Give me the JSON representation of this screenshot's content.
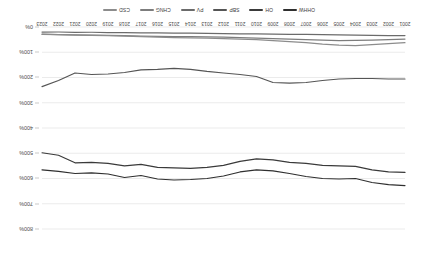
{
  "chart_data": {
    "type": "line",
    "title": "",
    "subtitle": "",
    "xlabel": "",
    "ylabel": "",
    "grid": true,
    "legend_position": "top",
    "orientation_note": "rendered rotated 180 degrees",
    "ylim": [
      0,
      800
    ],
    "yticks": [
      "0%",
      "100%",
      "200%",
      "300%",
      "400%",
      "500%",
      "600%",
      "700%",
      "800%"
    ],
    "ytick_values": [
      0,
      100,
      200,
      300,
      400,
      500,
      600,
      700,
      800
    ],
    "categories": [
      "2001",
      "2002",
      "2003",
      "2004",
      "2005",
      "2006",
      "2007",
      "2008",
      "2009",
      "2010",
      "2011",
      "2012",
      "2013",
      "2014",
      "2015",
      "2016",
      "2017",
      "2018",
      "2019",
      "2020",
      "2021",
      "2022",
      "2023"
    ],
    "series": [
      {
        "name": "OHHW",
        "color": "#2f2f2f",
        "values": [
          628,
          624,
          616,
          600,
          602,
          600,
          592,
          580,
          570,
          566,
          574,
          590,
          600,
          604,
          606,
          602,
          588,
          596,
          582,
          578,
          580,
          572,
          566
        ]
      },
      {
        "name": "OH",
        "color": "#3a3a3a",
        "values": [
          576,
          574,
          566,
          552,
          550,
          548,
          540,
          536,
          526,
          522,
          532,
          548,
          556,
          560,
          558,
          556,
          544,
          550,
          540,
          536,
          538,
          508,
          498
        ]
      },
      {
        "name": "SBP",
        "color": "#555555",
        "values": [
          206,
          206,
          204,
          204,
          206,
          212,
          220,
          222,
          220,
          196,
          188,
          182,
          176,
          168,
          164,
          168,
          170,
          180,
          186,
          188,
          182,
          212,
          236
        ]
      },
      {
        "name": "PV",
        "color": "#6b6b6b",
        "values": [
          34,
          34,
          33,
          32,
          31,
          30,
          29,
          29,
          28,
          27,
          27,
          26,
          25,
          24,
          24,
          23,
          23,
          22,
          22,
          21,
          21,
          20,
          20
        ]
      },
      {
        "name": "CHNG",
        "color": "#7d7d7d",
        "values": [
          48,
          50,
          52,
          53,
          54,
          52,
          50,
          48,
          46,
          44,
          42,
          40,
          39,
          38,
          38,
          37,
          36,
          34,
          33,
          32,
          31,
          30,
          28
        ]
      },
      {
        "name": "CSD",
        "color": "#8c8c8c",
        "values": [
          62,
          66,
          70,
          74,
          72,
          68,
          62,
          58,
          54,
          50,
          48,
          46,
          44,
          43,
          42,
          40,
          38,
          36,
          34,
          33,
          32,
          30,
          29
        ]
      }
    ]
  },
  "legend": {
    "items": [
      {
        "label": "OHHW",
        "color": "#2f2f2f"
      },
      {
        "label": "OH",
        "color": "#3a3a3a"
      },
      {
        "label": "SBP",
        "color": "#555555"
      },
      {
        "label": "PV",
        "color": "#6b6b6b"
      },
      {
        "label": "CHNG",
        "color": "#7d7d7d"
      },
      {
        "label": "CSD",
        "color": "#8c8c8c"
      }
    ]
  }
}
